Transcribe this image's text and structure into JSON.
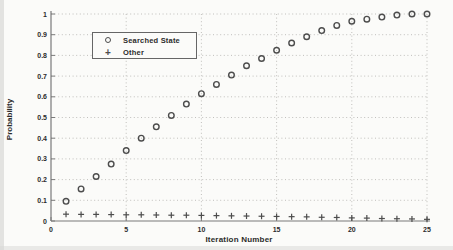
{
  "chart_data": {
    "type": "scatter",
    "title": "",
    "xlabel": "Iteration Number",
    "ylabel": "Probability",
    "xlim": [
      0,
      25
    ],
    "ylim": [
      0,
      1
    ],
    "grid": "dotted",
    "legend_position": "upper-left",
    "x_ticks": [
      0,
      5,
      10,
      15,
      20,
      25
    ],
    "x_tick_labels": [
      "0",
      "5",
      "10",
      "15",
      "20",
      "25"
    ],
    "y_ticks": [
      0,
      0.1,
      0.2,
      0.3,
      0.4,
      0.5,
      0.6,
      0.7,
      0.8,
      0.9,
      1
    ],
    "y_tick_labels": [
      "0",
      "0.1",
      "0.2",
      "0.3",
      "0.4",
      "0.5",
      "0.6",
      "0.7",
      "0.8",
      "0.9",
      "1"
    ],
    "x": [
      1,
      2,
      3,
      4,
      5,
      6,
      7,
      8,
      9,
      10,
      11,
      12,
      13,
      14,
      15,
      16,
      17,
      18,
      19,
      20,
      21,
      22,
      23,
      24,
      25
    ],
    "series": [
      {
        "name": "Searched State",
        "marker": "circle",
        "color": "#4d4d4d",
        "values": [
          0.095,
          0.155,
          0.215,
          0.275,
          0.34,
          0.4,
          0.455,
          0.51,
          0.565,
          0.615,
          0.66,
          0.705,
          0.75,
          0.785,
          0.825,
          0.86,
          0.89,
          0.92,
          0.945,
          0.965,
          0.975,
          0.985,
          0.995,
          1.0,
          1.0
        ]
      },
      {
        "name": "Other",
        "marker": "plus",
        "color": "#4d4d4d",
        "values": [
          0.033,
          0.032,
          0.032,
          0.031,
          0.03,
          0.03,
          0.029,
          0.028,
          0.028,
          0.027,
          0.026,
          0.025,
          0.024,
          0.023,
          0.022,
          0.021,
          0.02,
          0.018,
          0.017,
          0.015,
          0.014,
          0.012,
          0.011,
          0.01,
          0.008
        ]
      }
    ],
    "colors": {
      "axis": "#7a7a7a",
      "grid": "#bab9b6",
      "text": "#2b2b2b",
      "marker": "#4d4d4d"
    }
  }
}
